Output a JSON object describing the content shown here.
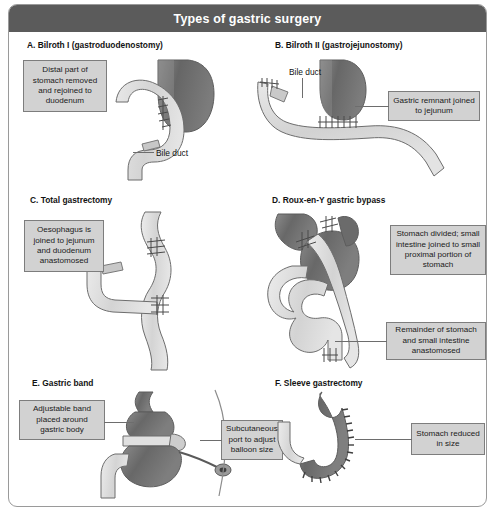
{
  "figure": {
    "title": "Types of gastric surgery",
    "width": 495,
    "height": 515,
    "title_bar_color": "#5b5b5b",
    "title_text_color": "#ffffff",
    "frame_border_color": "#9a9a9a",
    "callout_fill": "#d2d2d2",
    "callout_border": "#7d7d7d",
    "stomach_color": "#6f6f6f",
    "intestine_color": "#dcdcdc",
    "outline_color": "#6d6d6d"
  },
  "panels": [
    {
      "id": "a",
      "heading": "A. Bilroth I (gastroduodenostomy)",
      "callouts": [
        {
          "id": "a1",
          "text": "Distal part of stomach removed and rejoined to duodenum"
        }
      ],
      "labels": [
        {
          "id": "a-bile",
          "text": "Bile duct"
        }
      ]
    },
    {
      "id": "b",
      "heading": "B. Bilroth II (gastrojejunostomy)",
      "callouts": [
        {
          "id": "b1",
          "text": "Gastric remnant joined to jejunum"
        }
      ],
      "labels": [
        {
          "id": "b-bile",
          "text": "Bile duct"
        }
      ]
    },
    {
      "id": "c",
      "heading": "C. Total gastrectomy",
      "callouts": [
        {
          "id": "c1",
          "text": "Oesophagus is joined to jejunum and duodenum anastomosed"
        }
      ],
      "labels": []
    },
    {
      "id": "d",
      "heading": "D. Roux-en-Y gastric bypass",
      "callouts": [
        {
          "id": "d1",
          "text": "Stomach divided; small intestine joined to small proximal portion of stomach"
        },
        {
          "id": "d2",
          "text": "Remainder of stomach and small intestine anastomosed"
        }
      ],
      "labels": []
    },
    {
      "id": "e",
      "heading": "E. Gastric band",
      "callouts": [
        {
          "id": "e1",
          "text": "Adjustable band placed around gastric body"
        },
        {
          "id": "e2",
          "text": "Subcutaneous port to adjust balloon size"
        }
      ],
      "labels": []
    },
    {
      "id": "f",
      "heading": "F. Sleeve gastrectomy",
      "callouts": [
        {
          "id": "f1",
          "text": "Stomach reduced in size"
        }
      ],
      "labels": []
    }
  ]
}
